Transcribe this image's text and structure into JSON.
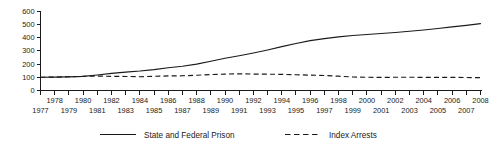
{
  "chart_data": {
    "type": "line",
    "title": "",
    "subtitle": "",
    "xlabel": "",
    "ylabel": "",
    "xlim": [
      1977,
      2008
    ],
    "ylim": [
      0,
      600
    ],
    "grid": false,
    "legend_position": "bottom",
    "y_ticks": [
      0,
      100,
      200,
      300,
      400,
      500,
      600
    ],
    "y_tick_labels": [
      "0",
      "100",
      "200",
      "300",
      "400",
      "500",
      "600"
    ],
    "x": [
      1977,
      1978,
      1979,
      1980,
      1981,
      1982,
      1983,
      1984,
      1985,
      1986,
      1987,
      1988,
      1989,
      1990,
      1991,
      1992,
      1993,
      1994,
      1995,
      1996,
      1997,
      1998,
      1999,
      2000,
      2001,
      2002,
      2003,
      2004,
      2005,
      2006,
      2007,
      2008
    ],
    "x_tick_labels_upper": [
      "1978",
      "1980",
      "1982",
      "1984",
      "1986",
      "1988",
      "1990",
      "1992",
      "1994",
      "1996",
      "1998",
      "2000",
      "2002",
      "2004",
      "2006",
      "2008"
    ],
    "x_tick_labels_lower": [
      "1977",
      "1979",
      "1981",
      "1983",
      "1985",
      "1987",
      "1989",
      "1991",
      "1993",
      "1995",
      "1997",
      "1999",
      "2001",
      "2003",
      "2005",
      "2007"
    ],
    "series": [
      {
        "name": "State and Federal Prison",
        "style": "solid",
        "color": "#1a1a1a",
        "values": [
          100,
          101,
          103,
          107,
          117,
          129,
          139,
          147,
          158,
          172,
          183,
          199,
          221,
          243,
          262,
          283,
          306,
          331,
          355,
          376,
          392,
          405,
          415,
          423,
          430,
          438,
          447,
          457,
          468,
          480,
          492,
          505
        ]
      },
      {
        "name": "Index Arrests",
        "style": "dashed",
        "color": "#1a1a1a",
        "values": [
          100,
          101,
          104,
          107,
          109,
          107,
          106,
          104,
          107,
          110,
          111,
          115,
          120,
          124,
          126,
          124,
          123,
          122,
          119,
          116,
          113,
          108,
          102,
          100,
          99,
          100,
          100,
          99,
          99,
          99,
          98,
          97
        ]
      }
    ],
    "legend": [
      {
        "label": "State and Federal Prison",
        "style": "solid"
      },
      {
        "label": "Index Arrests",
        "style": "dashed"
      }
    ]
  }
}
